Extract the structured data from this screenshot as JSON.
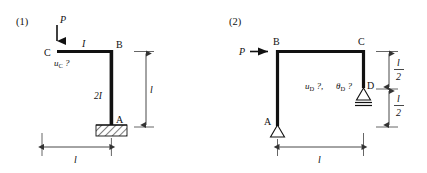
{
  "figure": {
    "background_color": "#ffffff",
    "ink_color": "#111111",
    "panels": [
      {
        "id": "panel-1",
        "number": "(1)",
        "load": {
          "label": "P",
          "direction": "down",
          "applied_at": "C"
        },
        "nodes": [
          {
            "name": "C",
            "label": "C",
            "role": "free-end-top-left"
          },
          {
            "name": "B",
            "label": "B",
            "role": "corner"
          },
          {
            "name": "A",
            "label": "A",
            "role": "fixed-support-base"
          }
        ],
        "members": [
          {
            "from": "C",
            "to": "B",
            "orientation": "horizontal",
            "stiffness_label": "I"
          },
          {
            "from": "B",
            "to": "A",
            "orientation": "vertical",
            "stiffness_label": "2I"
          }
        ],
        "supports": [
          {
            "at": "A",
            "type": "fixed",
            "symbol": "hatched-base"
          }
        ],
        "unknown_label": "u",
        "unknown_subscript": "C",
        "unknown_suffix": " ?",
        "dimensions": [
          {
            "name": "vertical-span",
            "label": "l",
            "orientation": "vertical",
            "side": "right"
          },
          {
            "name": "horizontal-span",
            "label": "l",
            "orientation": "horizontal",
            "side": "bottom"
          }
        ]
      },
      {
        "id": "panel-2",
        "number": "(2)",
        "load": {
          "label": "P",
          "direction": "right",
          "applied_at": "B"
        },
        "nodes": [
          {
            "name": "B",
            "label": "B",
            "role": "corner-top-left"
          },
          {
            "name": "C",
            "label": "C",
            "role": "corner-top-right"
          },
          {
            "name": "D",
            "label": "D",
            "role": "roller-support"
          },
          {
            "name": "A",
            "label": "A",
            "role": "pin-support-base"
          }
        ],
        "members": [
          {
            "from": "B",
            "to": "C",
            "orientation": "horizontal",
            "stiffness_label": ""
          },
          {
            "from": "B",
            "to": "A",
            "orientation": "vertical",
            "stiffness_label": ""
          },
          {
            "from": "C",
            "to": "D",
            "orientation": "vertical",
            "stiffness_label": ""
          }
        ],
        "supports": [
          {
            "at": "A",
            "type": "pin",
            "symbol": "open-triangle"
          },
          {
            "at": "D",
            "type": "roller",
            "symbol": "open-triangle-double-line"
          }
        ],
        "unknowns": [
          {
            "symbol": "u",
            "subscript": "D",
            "suffix": " ?,"
          },
          {
            "symbol": "θ",
            "subscript": "D",
            "suffix": " ?"
          }
        ],
        "dimensions": [
          {
            "name": "upper-half",
            "numerator": "l",
            "denominator": "2",
            "orientation": "vertical",
            "side": "right"
          },
          {
            "name": "lower-half",
            "numerator": "l",
            "denominator": "2",
            "orientation": "vertical",
            "side": "right"
          },
          {
            "name": "horizontal-span",
            "label": "l",
            "orientation": "horizontal",
            "side": "bottom"
          }
        ]
      }
    ]
  }
}
